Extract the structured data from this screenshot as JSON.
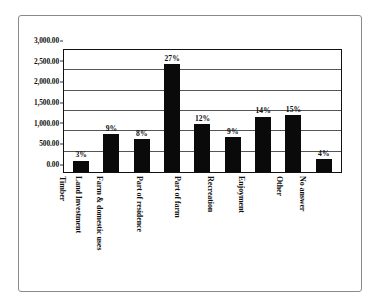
{
  "chart_data": {
    "type": "bar",
    "title": "",
    "subtitle": "",
    "xlabel": "",
    "ylabel": "",
    "categories": [
      "Timber",
      "Land Investment",
      "Farm & domestic uses",
      "Part of residence",
      "Part of farm",
      "Recreation",
      "Enjoyment",
      "Other",
      "No answer"
    ],
    "values": [
      280,
      930,
      810,
      2650,
      1170,
      860,
      1360,
      1390,
      320
    ],
    "data_labels": [
      "3%",
      "9%",
      "8%",
      "27%",
      "12%",
      "9%",
      "14%",
      "15%",
      "4%"
    ],
    "ylim": [
      0,
      3000
    ],
    "ytick_values": [
      0,
      500,
      1000,
      1500,
      2000,
      2500,
      3000
    ],
    "ytick_labels": [
      "0.00",
      "500.00",
      "1,000.00",
      "1,500.00",
      "2,000.00",
      "2,500.00",
      "3,000.00"
    ],
    "grid": true,
    "legend": false,
    "legend_position": "none",
    "bar_color": "#0a0a0a",
    "axis_color": "#111111",
    "gridline_color": "#555555",
    "background_color": "#ffffff",
    "frame_color": "#8a8a8a",
    "label_rotation_degrees": 90
  }
}
